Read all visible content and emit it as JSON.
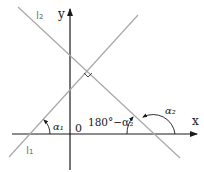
{
  "diagram": {
    "type": "coordinate geometry - perpendicular lines and inclination angles",
    "axes": {
      "x_label": "x",
      "y_label": "y",
      "origin_label": "0"
    },
    "lines": [
      {
        "id": "l1",
        "label": "l₁",
        "slope_direction": "positive"
      },
      {
        "id": "l2",
        "label": "l₂",
        "slope_direction": "negative"
      }
    ],
    "angles": {
      "alpha1": "α₁",
      "supplement": "180°−α₂",
      "alpha2": "α₂"
    },
    "right_angle_marker": true,
    "colors": {
      "axis": "#1a1a1a",
      "line": "#a8a8a8",
      "text": "#1a1a1a"
    }
  }
}
